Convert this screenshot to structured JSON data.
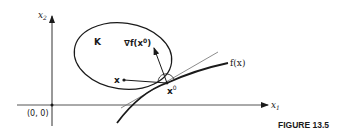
{
  "diagram": {
    "axes": {
      "x_label": "x",
      "x_sub": "1",
      "y_label": "x",
      "y_sub": "2",
      "origin_label": "(0, 0)"
    },
    "set_label": "K",
    "gradient_label": "∇f(x",
    "gradient_sup": "0",
    "gradient_close": ")",
    "point_x_label": "x",
    "point_x0_label": "x",
    "point_x0_sup": "0",
    "curve_label": "f(x)",
    "caption": "FIGURE 13.5"
  },
  "colors": {
    "ink": "#1a1a1a",
    "thin_line": "#6e6e6e",
    "background": "#ffffff"
  }
}
